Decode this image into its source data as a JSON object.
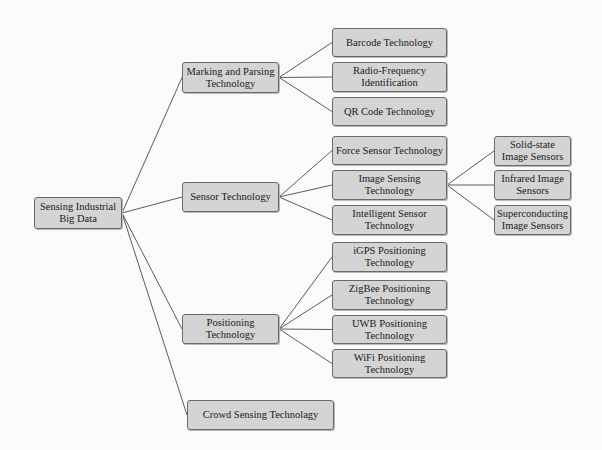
{
  "diagram": {
    "root": {
      "id": "root",
      "label": "Sensing Industrial Big Data",
      "box": [
        34,
        197,
        88,
        32
      ]
    },
    "nodes": [
      {
        "id": "marking",
        "label": "Marking and Parsing Technology",
        "parent": "root",
        "box": [
          182,
          62,
          97,
          31
        ]
      },
      {
        "id": "sensor",
        "label": "Sensor Technology",
        "parent": "root",
        "box": [
          182,
          182,
          97,
          30
        ]
      },
      {
        "id": "positioning",
        "label": "Positioning Technology",
        "parent": "root",
        "box": [
          182,
          314,
          97,
          30
        ]
      },
      {
        "id": "crowd",
        "label": "Crowd Sensing Technolagy",
        "parent": "root",
        "box": [
          187,
          400,
          147,
          30
        ]
      },
      {
        "id": "barcode",
        "label": "Barcode Technology",
        "parent": "marking",
        "box": [
          332,
          28,
          115,
          29
        ]
      },
      {
        "id": "rfid",
        "label": "Radio-Frequency Identification",
        "parent": "marking",
        "box": [
          332,
          62,
          115,
          30
        ]
      },
      {
        "id": "qr",
        "label": "QR Code Technology",
        "parent": "marking",
        "box": [
          332,
          97,
          115,
          29
        ]
      },
      {
        "id": "force",
        "label": "Force Sensor Technology",
        "parent": "sensor",
        "box": [
          332,
          136,
          115,
          29
        ]
      },
      {
        "id": "image",
        "label": "Image Sensing Technology",
        "parent": "sensor",
        "box": [
          332,
          170,
          115,
          30
        ]
      },
      {
        "id": "intelligent",
        "label": "Intelligent Sensor Technology",
        "parent": "sensor",
        "box": [
          332,
          205,
          115,
          30
        ]
      },
      {
        "id": "solid",
        "label": "Solid-state Image Sensors",
        "parent": "image",
        "box": [
          494,
          136,
          77,
          30
        ]
      },
      {
        "id": "infrared",
        "label": "Infrared Image Sensors",
        "parent": "image",
        "box": [
          494,
          170,
          77,
          30
        ]
      },
      {
        "id": "supercond",
        "label": "Superconducting Image Sensors",
        "parent": "image",
        "box": [
          494,
          205,
          77,
          30
        ]
      },
      {
        "id": "igps",
        "label": "iGPS Positioning Technology",
        "parent": "positioning",
        "box": [
          332,
          242,
          115,
          30
        ]
      },
      {
        "id": "zigbee",
        "label": "ZigBee Positioning Technology",
        "parent": "positioning",
        "box": [
          332,
          280,
          115,
          30
        ]
      },
      {
        "id": "uwb",
        "label": "UWB Positioning Technology",
        "parent": "positioning",
        "box": [
          332,
          315,
          115,
          29
        ]
      },
      {
        "id": "wifi",
        "label": "WiFi Positioning Technology",
        "parent": "positioning",
        "box": [
          332,
          349,
          115,
          29
        ]
      }
    ],
    "colors": {
      "node_fill": "#d4d4d4",
      "node_border": "#6a6a6a",
      "edge": "#4a4a4a",
      "background": "#fbfbfb"
    }
  }
}
